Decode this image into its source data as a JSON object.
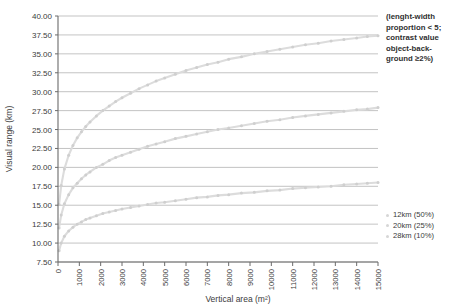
{
  "chart_data": {
    "type": "line",
    "title": "",
    "xlabel": "Vertical area (m²)",
    "ylabel": "Visual range (km)",
    "xlim": [
      0,
      15000
    ],
    "ylim": [
      7.5,
      40.0
    ],
    "xticks": [
      0,
      1000,
      2000,
      3000,
      4000,
      5000,
      6000,
      7000,
      8000,
      9000,
      10000,
      11000,
      12000,
      13000,
      14000,
      15000
    ],
    "xtick_labels": [
      "0",
      "1000",
      "2000",
      "3000",
      "4000",
      "5000",
      "6000",
      "7000",
      "8000",
      "9000",
      "10000",
      "11000",
      "12000",
      "13000",
      "14000",
      "15000"
    ],
    "yticks": [
      7.5,
      10.0,
      12.5,
      15.0,
      17.5,
      20.0,
      22.5,
      25.0,
      27.5,
      30.0,
      32.5,
      35.0,
      37.5,
      40.0
    ],
    "ytick_labels": [
      "7.50",
      "10.00",
      "12.50",
      "15.00",
      "17.50",
      "20.00",
      "22.50",
      "25.00",
      "27.50",
      "30.00",
      "32.50",
      "35.00",
      "37.50",
      "40.00"
    ],
    "grid": "horizontal",
    "legend_position": "right-bottom",
    "x": [
      50,
      150,
      300,
      500,
      700,
      900,
      1100,
      1300,
      1500,
      1800,
      2100,
      2400,
      2700,
      3000,
      3400,
      3800,
      4200,
      4600,
      5000,
      5500,
      6000,
      6500,
      7000,
      7500,
      8000,
      8600,
      9200,
      9800,
      10400,
      11000,
      11600,
      12200,
      12800,
      13400,
      14000,
      14500,
      15000
    ],
    "series": [
      {
        "name": "28km (10%)",
        "label": "28km (10%)",
        "color": "#dcdcdc",
        "values": [
          15.1,
          17.6,
          19.8,
          21.6,
          22.9,
          23.9,
          24.7,
          25.4,
          26.0,
          26.8,
          27.5,
          28.1,
          28.7,
          29.2,
          29.8,
          30.4,
          30.9,
          31.4,
          31.8,
          32.3,
          32.8,
          33.2,
          33.6,
          33.9,
          34.3,
          34.6,
          35.0,
          35.3,
          35.6,
          35.9,
          36.2,
          36.4,
          36.7,
          36.9,
          37.1,
          37.3,
          37.4
        ]
      },
      {
        "name": "20km (25%)",
        "label": "20km (25%)",
        "color": "#dcdcdc",
        "values": [
          12.0,
          13.7,
          15.2,
          16.4,
          17.3,
          17.9,
          18.5,
          19.0,
          19.4,
          20.0,
          20.4,
          20.9,
          21.3,
          21.6,
          22.0,
          22.4,
          22.8,
          23.1,
          23.4,
          23.8,
          24.1,
          24.4,
          24.7,
          25.0,
          25.2,
          25.5,
          25.8,
          26.1,
          26.3,
          26.6,
          26.8,
          27.0,
          27.2,
          27.4,
          27.6,
          27.7,
          27.9
        ]
      },
      {
        "name": "12km (50%)",
        "label": "12km (50%)",
        "color": "#dcdcdc",
        "values": [
          9.0,
          10.0,
          10.9,
          11.6,
          12.1,
          12.5,
          12.8,
          13.1,
          13.3,
          13.6,
          13.9,
          14.1,
          14.3,
          14.5,
          14.7,
          14.9,
          15.1,
          15.3,
          15.4,
          15.6,
          15.8,
          16.0,
          16.1,
          16.3,
          16.4,
          16.6,
          16.7,
          16.9,
          17.0,
          17.2,
          17.3,
          17.4,
          17.5,
          17.7,
          17.8,
          17.9,
          18.0
        ]
      }
    ],
    "legend": [
      {
        "label": "12km (50%)",
        "color": "#d6d6d6"
      },
      {
        "label": "20km (25%)",
        "color": "#d6d6d6"
      },
      {
        "label": "28km (10%)",
        "color": "#d6d6d6"
      }
    ],
    "annotation": {
      "lines": [
        "(lenght-width",
        "proportion < 5;",
        "contrast value",
        "object-back-",
        "ground ≥2%)"
      ]
    },
    "colors": {
      "axis": "#6b6b6b",
      "grid": "#a9a9a9",
      "text": "#3a3a3a",
      "series": "#dcdcdc",
      "background": "#ffffff"
    }
  }
}
